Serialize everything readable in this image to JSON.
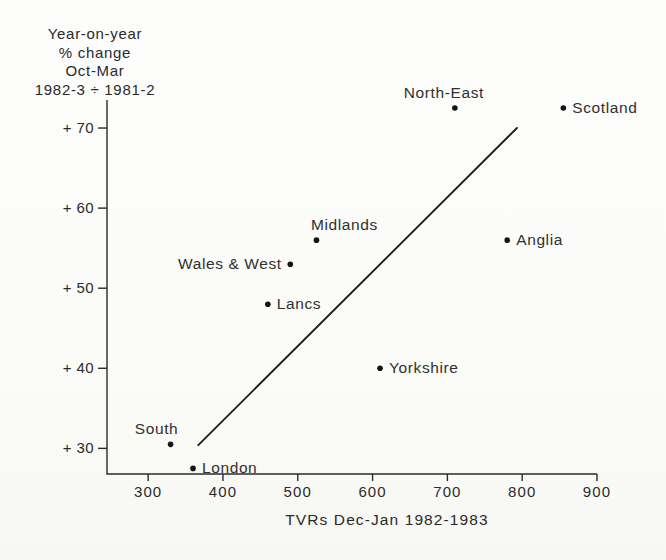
{
  "chart_data": {
    "type": "scatter",
    "y_axis_title_lines": [
      "Year-on-year",
      "% change",
      "Oct-Mar",
      "1982-3 ÷ 1981-2"
    ],
    "xlabel": "TVRs Dec-Jan 1982-1983",
    "x_axis": {
      "min": 245,
      "max": 900,
      "tick_values": [
        300,
        400,
        500,
        600,
        700,
        800,
        900
      ],
      "tick_labels": [
        "300",
        "400",
        "500",
        "600",
        "700",
        "800",
        "900"
      ]
    },
    "y_axis": {
      "min": 26.8,
      "max": 73.5,
      "tick_values": [
        30,
        40,
        50,
        60,
        70
      ],
      "tick_labels": [
        "+ 30",
        "+ 40",
        "+ 50",
        "+ 60",
        "+ 70"
      ]
    },
    "points": [
      {
        "region": "South",
        "x": 330,
        "y": 30.5,
        "label_pos": "above",
        "label_dx": -14
      },
      {
        "region": "London",
        "x": 360,
        "y": 27.5,
        "label_pos": "right",
        "label_dx": 0
      },
      {
        "region": "Lancs",
        "x": 460,
        "y": 48,
        "label_pos": "right",
        "label_dx": 0
      },
      {
        "region": "Wales & West",
        "x": 490,
        "y": 53,
        "label_pos": "left",
        "label_dx": 0
      },
      {
        "region": "Midlands",
        "x": 525,
        "y": 56,
        "label_pos": "above",
        "label_dx": 28
      },
      {
        "region": "Yorkshire",
        "x": 610,
        "y": 40,
        "label_pos": "right",
        "label_dx": 0
      },
      {
        "region": "North-East",
        "x": 710,
        "y": 72.5,
        "label_pos": "above",
        "label_dx": -11
      },
      {
        "region": "Anglia",
        "x": 780,
        "y": 56,
        "label_pos": "right",
        "label_dx": 0
      },
      {
        "region": "Scotland",
        "x": 855,
        "y": 72.5,
        "label_pos": "right",
        "label_dx": 0
      }
    ],
    "trend_line": {
      "x1": 367,
      "y1": 30.4,
      "x2": 793,
      "y2": 70
    },
    "grid": "off",
    "legend": "none",
    "colors": {
      "ink": "#2b2b2b",
      "dot": "#141414",
      "trend_line": "#1e1e1e",
      "background": "#fbfbf9"
    }
  }
}
